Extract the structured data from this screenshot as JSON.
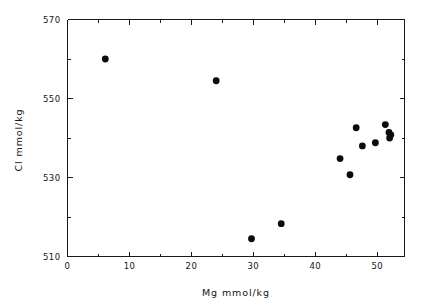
{
  "chart_data": {
    "type": "scatter",
    "title": "",
    "xlabel": "Mg  mmol/kg",
    "ylabel": "Cl  mmol/kg",
    "xlim": [
      0,
      54.4
    ],
    "ylim": [
      510,
      570
    ],
    "grid": false,
    "legend": null,
    "xticks": [
      0,
      10,
      20,
      30,
      40,
      50
    ],
    "xticklabels": [
      "0",
      "10",
      "20",
      "30",
      "40",
      "50"
    ],
    "xticks_minor": [
      5,
      15,
      25,
      35,
      45
    ],
    "yticks": [
      510,
      530,
      550,
      570
    ],
    "yticklabels": [
      "510",
      "530",
      "550",
      "570"
    ],
    "yticks_minor": [
      520,
      540,
      560
    ],
    "marker": "filled-circle",
    "marker_color": "#0b0b0b",
    "points": [
      {
        "x": 6.1,
        "y": 560.0
      },
      {
        "x": 24.0,
        "y": 554.5
      },
      {
        "x": 29.7,
        "y": 514.5
      },
      {
        "x": 34.5,
        "y": 518.3
      },
      {
        "x": 44.0,
        "y": 534.8
      },
      {
        "x": 45.6,
        "y": 530.7
      },
      {
        "x": 46.6,
        "y": 542.6
      },
      {
        "x": 47.6,
        "y": 538.0
      },
      {
        "x": 49.7,
        "y": 538.8
      },
      {
        "x": 51.3,
        "y": 543.4
      },
      {
        "x": 51.9,
        "y": 541.4
      },
      {
        "x": 52.2,
        "y": 540.8
      },
      {
        "x": 52.0,
        "y": 540.0
      }
    ]
  },
  "axes": {
    "x_label_text": "Mg  mmol/kg",
    "y_label_text": "Cl  mmol/kg"
  }
}
